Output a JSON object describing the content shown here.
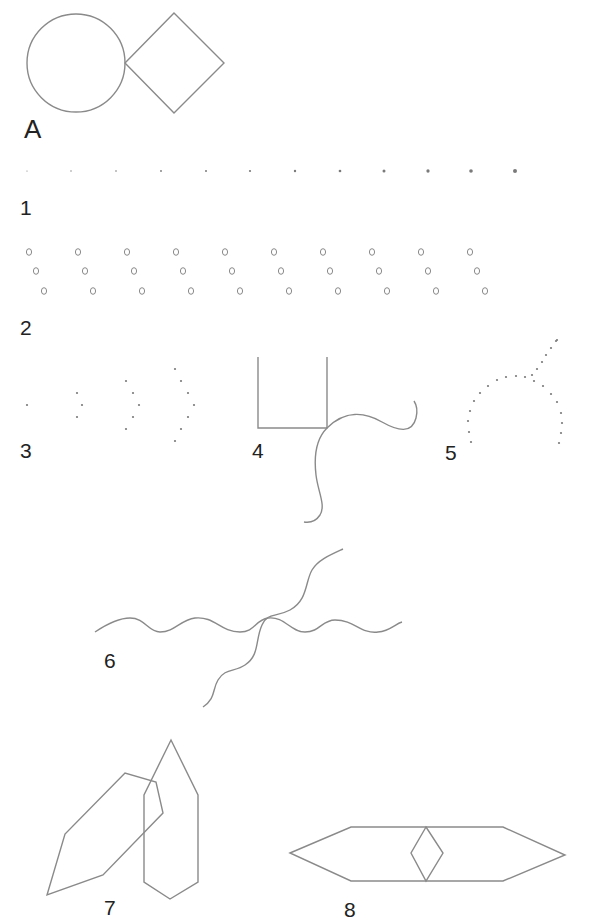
{
  "figure": {
    "labels": [
      {
        "id": "A",
        "text": "A",
        "x": 24,
        "y": 116,
        "big": true
      },
      {
        "id": "1",
        "text": "1",
        "x": 20,
        "y": 197
      },
      {
        "id": "2",
        "text": "2",
        "x": 20,
        "y": 317
      },
      {
        "id": "3",
        "text": "3",
        "x": 20,
        "y": 440
      },
      {
        "id": "4",
        "text": "4",
        "x": 252,
        "y": 440
      },
      {
        "id": "5",
        "text": "5",
        "x": 445,
        "y": 442
      },
      {
        "id": "6",
        "text": "6",
        "x": 104,
        "y": 650
      },
      {
        "id": "7",
        "text": "7",
        "x": 104,
        "y": 897
      },
      {
        "id": "8",
        "text": "8",
        "x": 344,
        "y": 899
      }
    ]
  },
  "colors": {
    "stroke": "#8a8a8a",
    "dot": "#7a7a7a",
    "label": "#222222",
    "background": "#ffffff"
  },
  "figure_A": {
    "circle": {
      "cx": 76,
      "cy": 63,
      "r": 49
    },
    "diamond": [
      [
        125,
        63
      ],
      [
        174,
        13
      ],
      [
        224,
        63
      ],
      [
        174,
        113
      ]
    ]
  },
  "figure_1": {
    "description": "row of dots increasing in size",
    "y": 171,
    "dots": [
      {
        "x": 27,
        "r": 0.6
      },
      {
        "x": 71,
        "r": 0.7
      },
      {
        "x": 116,
        "r": 0.8
      },
      {
        "x": 161,
        "r": 0.9
      },
      {
        "x": 206,
        "r": 1.0
      },
      {
        "x": 250,
        "r": 1.1
      },
      {
        "x": 295,
        "r": 1.2
      },
      {
        "x": 340,
        "r": 1.35
      },
      {
        "x": 384,
        "r": 1.5
      },
      {
        "x": 428,
        "r": 1.65
      },
      {
        "x": 471,
        "r": 1.8
      },
      {
        "x": 515,
        "r": 2.0
      }
    ]
  },
  "figure_2": {
    "description": "ten diagonal groups of three small circles",
    "group_start_x": 29,
    "group_spacing": 49,
    "group_count": 10,
    "offsets": [
      [
        0,
        252
      ],
      [
        7,
        271
      ],
      [
        15,
        291
      ]
    ],
    "glyph_rx": 2.6,
    "glyph_ry": 3.3
  },
  "figure_3": {
    "description": "dot groups forming chevrons of increasing size",
    "dots": [
      [
        27,
        405
      ],
      [
        77,
        393
      ],
      [
        82,
        405
      ],
      [
        77,
        417
      ],
      [
        126,
        381
      ],
      [
        133,
        393
      ],
      [
        139,
        405
      ],
      [
        133,
        417
      ],
      [
        126,
        429
      ],
      [
        175,
        369
      ],
      [
        181,
        381
      ],
      [
        188,
        393
      ],
      [
        194,
        405
      ],
      [
        188,
        417
      ],
      [
        181,
        429
      ],
      [
        175,
        441
      ]
    ],
    "r": 1.1
  },
  "figure_4": {
    "box_path": "M258 357 L258 428 L327 428 L327 357",
    "curve_right": "M327 428 C345 410, 365 412, 382 422 C398 431, 412 434, 416 418 C418 410, 416 404, 414 401",
    "curve_down": "M327 428 C315 440, 314 458, 316 475 C318 492, 326 505, 320 515 C316 521, 310 523, 304 522"
  },
  "figure_5": {
    "description": "dotted arc with branching dotted line",
    "dots": [
      [
        471,
        442
      ],
      [
        469,
        432
      ],
      [
        468,
        421
      ],
      [
        470,
        411
      ],
      [
        474,
        401
      ],
      [
        480,
        393
      ],
      [
        488,
        386
      ],
      [
        497,
        380
      ],
      [
        506,
        377
      ],
      [
        516,
        376
      ],
      [
        525,
        377
      ],
      [
        532,
        375
      ],
      [
        537,
        369
      ],
      [
        542,
        362
      ],
      [
        546,
        355
      ],
      [
        551,
        348
      ],
      [
        556,
        341
      ],
      [
        557,
        340
      ],
      [
        534,
        381
      ],
      [
        543,
        386
      ],
      [
        551,
        394
      ],
      [
        557,
        402
      ],
      [
        561,
        413
      ],
      [
        562,
        423
      ],
      [
        561,
        433
      ],
      [
        559,
        443
      ]
    ],
    "r": 1.1
  },
  "figure_6": {
    "wave_horizontal": "M95 632 C110 622, 120 618, 130 618 C145 618, 148 632, 160 632 C175 632, 180 620, 195 618 C215 616, 220 632, 240 632 C255 632, 255 620, 268 618 C285 616, 290 632, 305 632 C320 632, 322 620, 335 620 C355 620, 360 634, 378 632 C390 631, 395 624, 402 622",
    "wave_diagonal": "M343 549 C330 555, 318 560, 312 570 C305 582, 308 600, 290 610 C275 618, 268 612, 262 625 C255 640, 260 655, 245 665 C235 672, 225 668, 218 680 C212 690, 216 698, 203 707"
  },
  "figure_7": {
    "tilted_hexagon": [
      [
        47,
        895
      ],
      [
        65,
        834
      ],
      [
        125,
        773
      ],
      [
        156,
        782
      ],
      [
        163,
        813
      ],
      [
        103,
        875
      ]
    ],
    "vertical_hexagon": [
      [
        171,
        740
      ],
      [
        198,
        795
      ],
      [
        198,
        882
      ],
      [
        170,
        899
      ],
      [
        144,
        882
      ],
      [
        144,
        795
      ]
    ]
  },
  "figure_8": {
    "outer_hexagon": [
      [
        290,
        853
      ],
      [
        351,
        827
      ],
      [
        503,
        827
      ],
      [
        565,
        855
      ],
      [
        503,
        881
      ],
      [
        351,
        881
      ]
    ],
    "inner_diamond": [
      [
        426,
        827
      ],
      [
        443,
        853
      ],
      [
        426,
        881
      ],
      [
        411,
        853
      ]
    ]
  }
}
